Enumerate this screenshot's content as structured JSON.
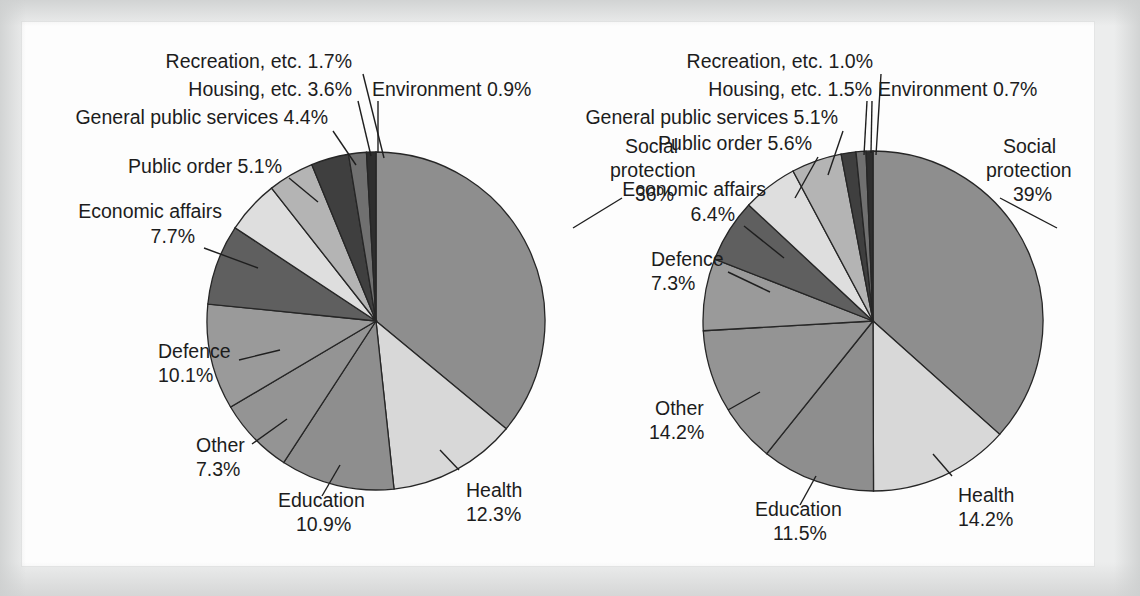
{
  "figure": {
    "background_color": "#fdfdfd",
    "frame_color": "#e3e4e4",
    "label_color": "#1c1c1c",
    "outline_color": "#262626"
  },
  "palette": {
    "mid_grey": "#8e8e8e",
    "light_grey": "#d8d8d8",
    "dark_grey": "#585858",
    "darkest_grey": "#3b3b3b",
    "pale_grey": "#c2c2c2"
  },
  "chart_data": [
    {
      "type": "pie",
      "name": "left-pie",
      "title": "",
      "start_angle_deg": 0,
      "direction": "clockwise",
      "center": {
        "x": 376,
        "y": 321
      },
      "radius": 169,
      "labels": [
        "Social protection",
        "Health",
        "Education",
        "Other",
        "Defence",
        "Economic affairs",
        "Public order",
        "General public services",
        "Housing, etc.",
        "Recreation, etc.",
        "Environment"
      ],
      "values": [
        36,
        12.3,
        10.9,
        7.3,
        10.1,
        7.7,
        5.1,
        4.4,
        3.6,
        1.7,
        0.9
      ],
      "value_labels": [
        "36%",
        "12.3%",
        "10.9%",
        "7.3%",
        "10.1%",
        "7.7%",
        "5.1%",
        "4.4%",
        "3.6%",
        "1.7%",
        "0.9%"
      ],
      "colors": [
        "#8e8e8e",
        "#d8d8d8",
        "#8e8e8e",
        "#949494",
        "#9a9a9a",
        "#5f5f5f",
        "#dedede",
        "#b4b4b4",
        "#3f3f3f",
        "#707070",
        "#2e2e2e"
      ],
      "annotations": [
        {
          "text": "Social protection",
          "line2": "36%"
        },
        {
          "text": "Health",
          "line2": "12.3%"
        },
        {
          "text": "Education",
          "line2": "10.9%"
        },
        {
          "text": "Other",
          "line2": "7.3%"
        },
        {
          "text": "Defence",
          "line2": "10.1%"
        },
        {
          "text": "Economic affairs",
          "line2": "7.7%"
        },
        {
          "text": "Public order 5.1%",
          "line2": ""
        },
        {
          "text": "General public services 4.4%",
          "line2": ""
        },
        {
          "text": "Housing, etc. 3.6%",
          "line2": ""
        },
        {
          "text": "Recreation, etc. 1.7%",
          "line2": ""
        },
        {
          "text": "Environment 0.9%",
          "line2": ""
        }
      ]
    },
    {
      "type": "pie",
      "name": "right-pie",
      "title": "",
      "start_angle_deg": 0,
      "direction": "clockwise",
      "center": {
        "x": 873,
        "y": 321
      },
      "radius": 170,
      "labels": [
        "Social protection",
        "Health",
        "Education",
        "Other",
        "Defence",
        "Economic affairs",
        "Public order",
        "General public services",
        "Housing, etc.",
        "Recreation, etc.",
        "Environment"
      ],
      "values": [
        39,
        14.2,
        11.5,
        14.2,
        7.3,
        6.4,
        5.6,
        5.1,
        1.5,
        1.0,
        0.7
      ],
      "value_labels": [
        "39%",
        "14.2%",
        "11.5%",
        "14.2%",
        "7.3%",
        "6.4%",
        "5.6%",
        "5.1%",
        "1.5%",
        "1.0%",
        "0.7%"
      ],
      "colors": [
        "#8e8e8e",
        "#d8d8d8",
        "#8e8e8e",
        "#949494",
        "#9a9a9a",
        "#5f5f5f",
        "#dedede",
        "#b4b4b4",
        "#3f3f3f",
        "#707070",
        "#2e2e2e"
      ],
      "annotations": [
        {
          "text": "Social protection",
          "line2": "39%"
        },
        {
          "text": "Health",
          "line2": "14.2%"
        },
        {
          "text": "Education",
          "line2": "11.5%"
        },
        {
          "text": "Other",
          "line2": "14.2%"
        },
        {
          "text": "Defence",
          "line2": "7.3%"
        },
        {
          "text": "Economic affairs",
          "line2": "6.4%"
        },
        {
          "text": "Public order 5.6%",
          "line2": ""
        },
        {
          "text": "General public services 5.1%",
          "line2": ""
        },
        {
          "text": "Housing, etc. 1.5%",
          "line2": ""
        },
        {
          "text": "Recreation, etc. 1.0%",
          "line2": ""
        },
        {
          "text": "Environment 0.7%",
          "line2": ""
        }
      ]
    }
  ],
  "left_chart_text": {
    "recreation": "Recreation, etc. 1.7%",
    "housing": "Housing, etc. 3.6%",
    "environment": "Environment 0.9%",
    "general_public_services": "General public services 4.4%",
    "public_order": "Public order 5.1%",
    "economic_affairs_name": "Economic affairs",
    "economic_affairs_value": "7.7%",
    "social_protection_name_1": "Social",
    "social_protection_name_2": "protection",
    "social_protection_value": "36%",
    "defence_name": "Defence",
    "defence_value": "10.1%",
    "other_name": "Other",
    "other_value": "7.3%",
    "education_name": "Education",
    "education_value": "10.9%",
    "health_name": "Health",
    "health_value": "12.3%"
  },
  "right_chart_text": {
    "recreation": "Recreation, etc. 1.0%",
    "housing": "Housing, etc. 1.5%",
    "environment": "Environment 0.7%",
    "general_public_services": "General public services 5.1%",
    "public_order": "Public order 5.6%",
    "economic_affairs_name": "Economic affairs",
    "economic_affairs_value": "6.4%",
    "social_protection_name_1": "Social",
    "social_protection_name_2": "protection",
    "social_protection_value": "39%",
    "defence_name": "Defence",
    "defence_value": "7.3%",
    "other_name": "Other",
    "other_value": "14.2%",
    "education_name": "Education",
    "education_value": "11.5%",
    "health_name": "Health",
    "health_value": "14.2%"
  }
}
